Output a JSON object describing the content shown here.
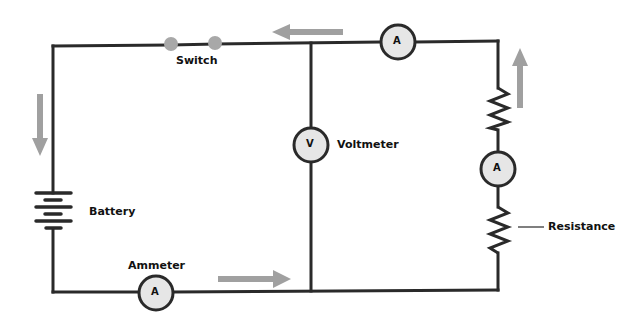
{
  "diagram": {
    "type": "electric circuit",
    "labels": {
      "switch": "Switch",
      "voltmeter": "Voltmeter",
      "battery": "Battery",
      "ammeter": "Ammeter",
      "resistance": "Resistance"
    },
    "meter_symbols": {
      "ammeter": "A",
      "voltmeter": "V"
    },
    "colors": {
      "wire": "#2a2a2a",
      "arrow": "#a0a0a0",
      "meter_fill": "#e6e6e6",
      "switch_contact": "#a8a8a8"
    },
    "current_arrows": [
      "left (top wire)",
      "down (left wire)",
      "right (bottom wire)",
      "up (right wire)"
    ]
  }
}
